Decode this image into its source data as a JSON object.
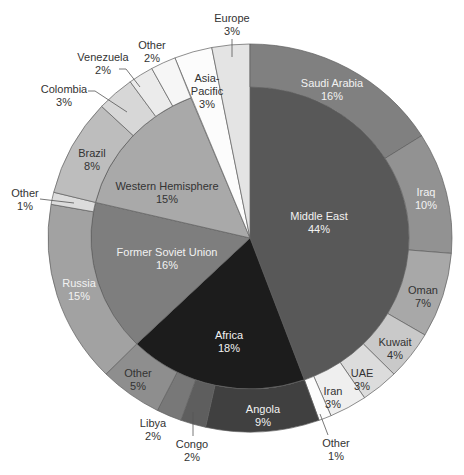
{
  "chart_data": {
    "type": "sunburst",
    "title": "",
    "subtitle": "",
    "xlabel": "",
    "ylabel": "",
    "legend": "none",
    "unit": "%",
    "total": 99,
    "geometry": {
      "cx": 250,
      "cy": 238,
      "outer_rx": 202,
      "outer_ry": 194,
      "inner_rx": 159,
      "inner_ry": 151,
      "start_angle": 0,
      "direction": "clockwise"
    },
    "dark_text": "#333333",
    "light_text": "#f2f2f2",
    "inner": [
      {
        "name": "Middle East",
        "value": 44,
        "pct": "44%",
        "color": "#585858",
        "text": "light",
        "label": [
          319,
          216
        ]
      },
      {
        "name": "Africa",
        "value": 18,
        "pct": "18%",
        "color": "#1c1c1c",
        "text": "light",
        "label": [
          229,
          335
        ]
      },
      {
        "name": "Former Soviet Union",
        "value": 16,
        "pct": "16%",
        "color": "#7e7e7e",
        "text": "light",
        "label": [
          167,
          252
        ]
      },
      {
        "name": "Western Hemisphere",
        "value": 15,
        "pct": "15%",
        "color": "#a9a9a9",
        "text": "dark",
        "label": [
          167,
          186
        ]
      },
      {
        "name": "Asia-Pacific",
        "lines": [
          "Asia-",
          "Pacific"
        ],
        "value": 3,
        "pct": "3%",
        "color": "#fcfcfc",
        "text": "dark",
        "full": true,
        "label": [
          207,
          78
        ]
      },
      {
        "name": "Europe",
        "value": 3,
        "pct": "3%",
        "color": "#e4e4e4",
        "text": "dark",
        "full": true,
        "label": [
          232,
          18
        ],
        "leader": [
          [
            232,
            39
          ],
          [
            232,
            57
          ]
        ]
      }
    ],
    "outer": [
      {
        "parent": "Middle East",
        "name": "Saudi Arabia",
        "value": 16,
        "pct": "16%",
        "color": "#808080",
        "text": "light",
        "label": [
          332,
          83
        ]
      },
      {
        "parent": "Middle East",
        "name": "Iraq",
        "value": 10,
        "pct": "10%",
        "color": "#929292",
        "text": "light",
        "label": [
          426,
          192
        ]
      },
      {
        "parent": "Middle East",
        "name": "Oman",
        "value": 7,
        "pct": "7%",
        "color": "#a8a8a8",
        "text": "dark",
        "label": [
          423,
          290
        ]
      },
      {
        "parent": "Middle East",
        "name": "Kuwait",
        "value": 4,
        "pct": "4%",
        "color": "#c9c9c9",
        "text": "dark",
        "label": [
          395,
          342
        ]
      },
      {
        "parent": "Middle East",
        "name": "UAE",
        "value": 3,
        "pct": "3%",
        "color": "#dcdcdc",
        "text": "dark",
        "label": [
          362,
          373
        ]
      },
      {
        "parent": "Middle East",
        "name": "Iran",
        "value": 3,
        "pct": "3%",
        "color": "#efefef",
        "text": "dark",
        "label": [
          333,
          391
        ]
      },
      {
        "parent": "Middle East",
        "name": "Other",
        "value": 1,
        "pct": "1%",
        "color": "#fcfcfc",
        "text": "dark",
        "label": [
          336,
          443
        ],
        "leader": [
          [
            328,
            435
          ],
          [
            320,
            414
          ]
        ]
      },
      {
        "parent": "Africa",
        "name": "Angola",
        "value": 9,
        "pct": "9%",
        "color": "#404040",
        "text": "light",
        "label": [
          263,
          409
        ]
      },
      {
        "parent": "Africa",
        "name": "Congo",
        "value": 2,
        "pct": "2%",
        "color": "#5e5e5e",
        "text": "dark",
        "label": [
          192,
          444
        ],
        "leader": [
          [
            193,
            436
          ],
          [
            193,
            412
          ]
        ]
      },
      {
        "parent": "Africa",
        "name": "Libya",
        "value": 2,
        "pct": "2%",
        "color": "#787878",
        "text": "dark",
        "label": [
          153,
          423
        ]
      },
      {
        "parent": "Africa",
        "name": "Other",
        "value": 5,
        "pct": "5%",
        "color": "#8e8e8e",
        "text": "dark",
        "label": [
          138,
          373
        ]
      },
      {
        "parent": "Former Soviet Union",
        "name": "Russia",
        "value": 15,
        "pct": "15%",
        "color": "#a2a2a2",
        "text": "light",
        "label": [
          79,
          283
        ]
      },
      {
        "parent": "Former Soviet Union",
        "name": "Other",
        "value": 1,
        "pct": "1%",
        "color": "#dcdcdc",
        "text": "dark",
        "label": [
          25,
          193
        ],
        "leader": [
          [
            40,
            199
          ],
          [
            74,
            203
          ]
        ]
      },
      {
        "parent": "Western Hemisphere",
        "name": "Brazil",
        "value": 8,
        "pct": "8%",
        "color": "#bdbdbd",
        "text": "dark",
        "label": [
          92,
          153
        ]
      },
      {
        "parent": "Western Hemisphere",
        "name": "Colombia",
        "value": 3,
        "pct": "3%",
        "color": "#d7d7d7",
        "text": "dark",
        "label": [
          64,
          89
        ],
        "leader": [
          [
            88,
            91
          ],
          [
            95,
            91
          ],
          [
            127,
            112
          ]
        ]
      },
      {
        "parent": "Western Hemisphere",
        "name": "Venezuela",
        "value": 2,
        "pct": "2%",
        "color": "#ebebeb",
        "text": "dark",
        "label": [
          103,
          57
        ],
        "leader": [
          [
            119,
            69
          ],
          [
            126,
            69
          ],
          [
            140,
            87
          ]
        ]
      },
      {
        "parent": "Western Hemisphere",
        "name": "Other",
        "value": 2,
        "pct": "2%",
        "color": "#f6f6f6",
        "text": "dark",
        "label": [
          152,
          45
        ]
      }
    ]
  }
}
